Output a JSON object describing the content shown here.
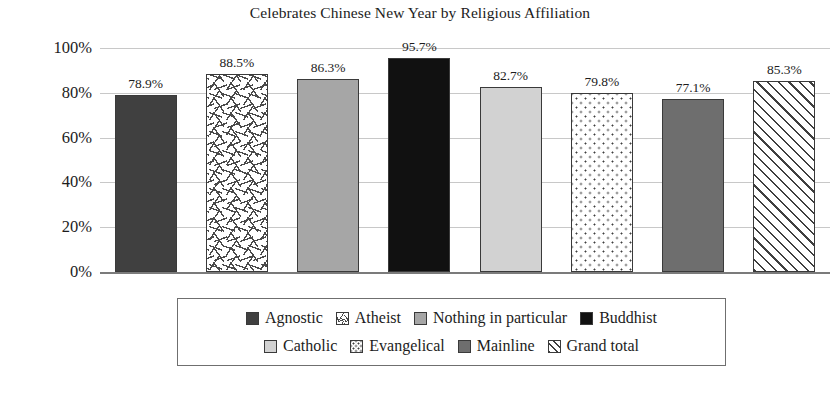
{
  "chart_data": {
    "type": "bar",
    "title": "Celebrates Chinese New Year by Religious Affiliation",
    "xlabel": "",
    "ylabel": "",
    "ylim": [
      0,
      100
    ],
    "grid": true,
    "legend_position": "bottom",
    "categories": [
      "Agnostic",
      "Atheist",
      "Nothing in particular",
      "Buddhist",
      "Catholic",
      "Evangelical",
      "Mainline",
      "Grand total"
    ],
    "values": [
      78.9,
      88.5,
      86.3,
      95.7,
      82.7,
      79.8,
      77.1,
      85.3
    ],
    "data_labels": [
      "78.9%",
      "88.5%",
      "86.3%",
      "95.7%",
      "82.7%",
      "79.8%",
      "77.1%",
      "85.3%"
    ],
    "ytick_labels": [
      "100%",
      "80%",
      "60%",
      "40%",
      "20%",
      "0%"
    ],
    "ytick_values": [
      100,
      80,
      60,
      40,
      20,
      0
    ],
    "bar_styles": [
      "solid-dark-gray",
      "white-chevron-pattern",
      "solid-medium-gray",
      "solid-black",
      "solid-light-gray",
      "white-dot-pattern",
      "solid-gray",
      "white-diagonal-hatch"
    ],
    "bar_colors": [
      "#404040",
      "#ffffff",
      "#a6a6a6",
      "#111111",
      "#d2d2d2",
      "#ffffff",
      "#6e6e6e",
      "#ffffff"
    ]
  },
  "legend": {
    "rows": [
      [
        {
          "label": "Agnostic",
          "swatch": "solid-dark-gray"
        },
        {
          "label": "Atheist",
          "swatch": "white-chevron-pattern"
        },
        {
          "label": "Nothing in particular",
          "swatch": "solid-medium-gray"
        },
        {
          "label": "Buddhist",
          "swatch": "solid-black"
        }
      ],
      [
        {
          "label": "Catholic",
          "swatch": "solid-light-gray"
        },
        {
          "label": "Evangelical",
          "swatch": "white-dot-pattern"
        },
        {
          "label": "Mainline",
          "swatch": "solid-gray"
        },
        {
          "label": "Grand total",
          "swatch": "white-diagonal-hatch"
        }
      ]
    ]
  }
}
